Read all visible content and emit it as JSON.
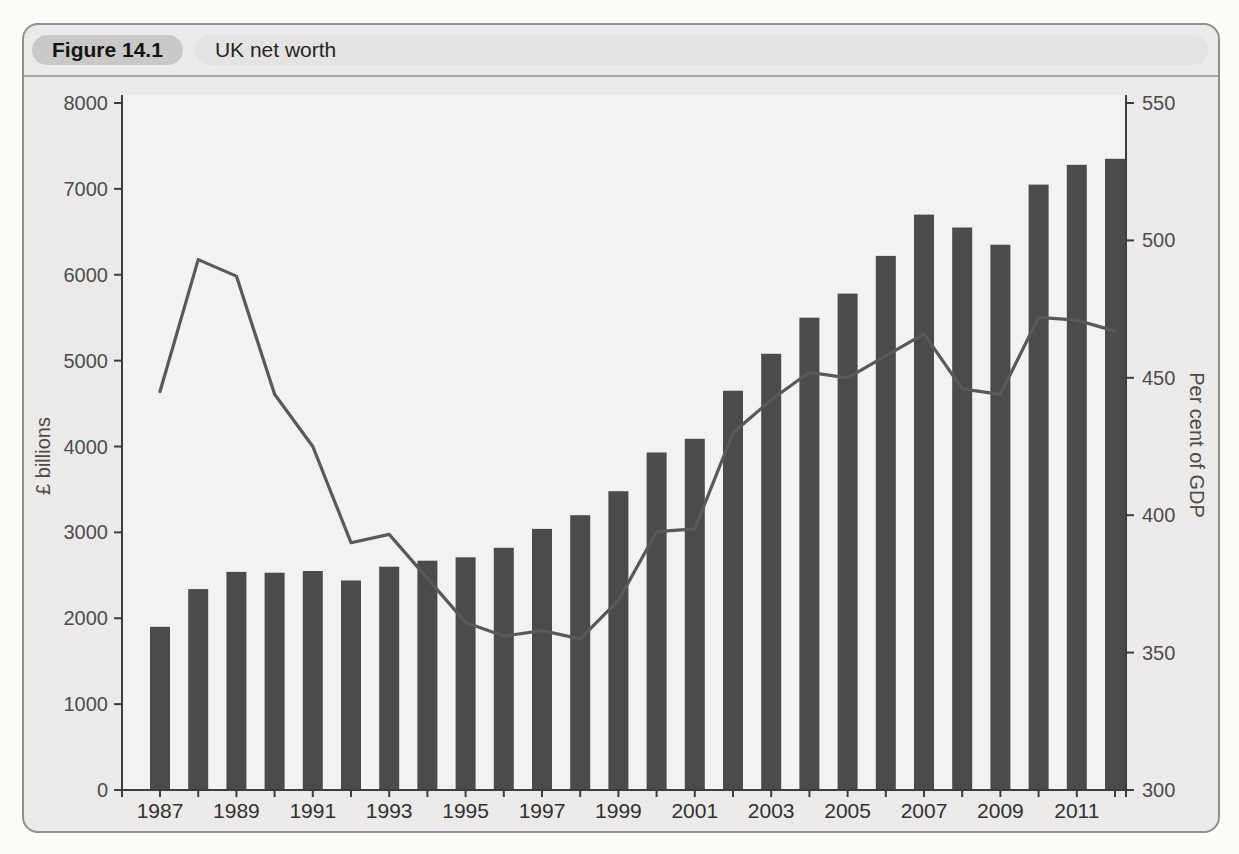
{
  "figure": {
    "label": "Figure 14.1",
    "title": "UK net worth"
  },
  "colors": {
    "page_bg": "#fbfbf8",
    "panel_bg": "#ebeae8",
    "panel_border": "#90908e",
    "figure_pill_bg": "#c9c8c6",
    "title_pill_bg": "#e4e3e1",
    "divider": "#a9a8a6",
    "plot_bg": "#f3f2f0",
    "bar": "#4b4b4e",
    "line": "#59595b",
    "axis": "#3d3d3d",
    "tick_text": "#4d4d4d",
    "year_text": "#303030"
  },
  "chart_data": {
    "type": "bar",
    "title": "UK net worth",
    "grid": false,
    "legend": "none",
    "categories": [
      1987,
      1988,
      1989,
      1990,
      1991,
      1992,
      1993,
      1994,
      1995,
      1996,
      1997,
      1998,
      1999,
      2000,
      2001,
      2002,
      2003,
      2004,
      2005,
      2006,
      2007,
      2008,
      2009,
      2010,
      2011,
      2012
    ],
    "x_axis": {
      "labeled_years": [
        1987,
        1989,
        1991,
        1993,
        1995,
        1997,
        1999,
        2001,
        2003,
        2005,
        2007,
        2009,
        2011
      ]
    },
    "left_axis": {
      "label": "£ billions",
      "min": 0,
      "max": 8000,
      "ticks": [
        0,
        1000,
        2000,
        3000,
        4000,
        5000,
        6000,
        7000,
        8000
      ]
    },
    "right_axis": {
      "label": "Per cent of GDP",
      "min": 300,
      "max": 550,
      "ticks": [
        300,
        350,
        400,
        450,
        500,
        550
      ]
    },
    "series": [
      {
        "name": "£ billions",
        "type": "bar",
        "axis": "left",
        "values": [
          1900,
          2340,
          2540,
          2530,
          2550,
          2440,
          2600,
          2670,
          2710,
          2820,
          3040,
          3200,
          3480,
          3930,
          4090,
          4650,
          5080,
          5500,
          5780,
          6220,
          6700,
          6550,
          6350,
          7050,
          7280,
          7350
        ]
      },
      {
        "name": "Per cent of GDP",
        "type": "line",
        "axis": "right",
        "values": [
          445,
          493,
          487,
          444,
          425,
          390,
          393,
          377,
          361,
          356,
          358,
          355,
          369,
          394,
          395,
          430,
          442,
          452,
          450,
          458,
          466,
          446,
          444,
          472,
          471,
          467
        ]
      }
    ]
  }
}
